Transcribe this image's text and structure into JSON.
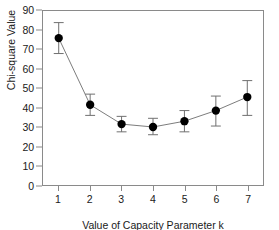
{
  "chart_data": {
    "type": "line",
    "title": "",
    "xlabel": "Value of Capacity Parameter k",
    "ylabel": "Chi-square Value",
    "x": [
      1,
      2,
      3,
      4,
      5,
      6,
      7
    ],
    "values": [
      76,
      41.5,
      31.5,
      30,
      33,
      38.5,
      45.5
    ],
    "error_low": [
      68,
      36,
      27.5,
      26,
      27.5,
      30.5,
      36
    ],
    "error_high": [
      84,
      47,
      35.5,
      34.5,
      38.5,
      46,
      54
    ],
    "xlim": [
      0.5,
      7.5
    ],
    "ylim": [
      0,
      90
    ],
    "xticks": [
      "1",
      "2",
      "3",
      "4",
      "5",
      "6",
      "7"
    ],
    "yticks": [
      "0",
      "10",
      "20",
      "30",
      "40",
      "50",
      "60",
      "70",
      "80",
      "90"
    ],
    "grid": false,
    "legend": "none",
    "marker": "filled-circle",
    "marker_color": "#000000",
    "line_color": "#7a7a7a",
    "errorbar_color": "#6e6e6e",
    "frame_color": "#8a8a8a",
    "background": "#ffffff"
  }
}
